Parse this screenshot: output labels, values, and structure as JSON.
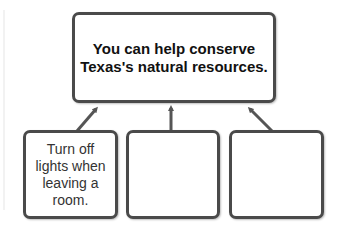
{
  "main": {
    "line1": "You can help conserve",
    "line2": "Texas's natural resources."
  },
  "supporting_boxes": [
    {
      "text": "Turn off lights when leaving a room."
    },
    {
      "text": ""
    },
    {
      "text": ""
    }
  ],
  "colors": {
    "border": "#4a4a4a",
    "arrow": "#555555",
    "text": "#111111",
    "background": "#ffffff"
  },
  "icons": {
    "arrow": "arrow-up-icon"
  }
}
